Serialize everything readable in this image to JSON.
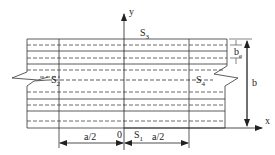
{
  "diagram": {
    "colors": {
      "line": "#333333",
      "dashed": "#444444",
      "text": "#222222"
    },
    "axes": {
      "x_label": "x",
      "y_label": "y",
      "origin_label": "0"
    },
    "edges": {
      "bottom": "S1",
      "left": "S2",
      "top": "S3",
      "right": "S4"
    },
    "edge_labels": {
      "s1": "S",
      "s1_sub": "1",
      "s2": "S",
      "s2_sub": "2",
      "s3": "S",
      "s3_sub": "3",
      "s4": "S",
      "s4_sub": "4"
    },
    "dimensions": {
      "left_half": "a/2",
      "right_half": "a/2",
      "width": "b",
      "effective_width": "b",
      "effective_width_sub": "e"
    }
  }
}
